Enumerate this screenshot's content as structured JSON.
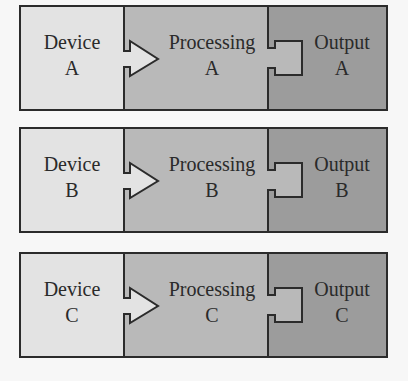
{
  "colors": {
    "device": "#e3e3e3",
    "processing": "#b9b9b9",
    "output": "#9c9c9c",
    "stroke": "#2b2b2b",
    "background": "#f7f7f7"
  },
  "rows": [
    {
      "id": "A",
      "device": {
        "title": "Device",
        "letter": "A"
      },
      "processing": {
        "title": "Processing",
        "letter": "A"
      },
      "output": {
        "title": "Output",
        "letter": "A"
      }
    },
    {
      "id": "B",
      "device": {
        "title": "Device",
        "letter": "B"
      },
      "processing": {
        "title": "Processing",
        "letter": "B"
      },
      "output": {
        "title": "Output",
        "letter": "B"
      }
    },
    {
      "id": "C",
      "device": {
        "title": "Device",
        "letter": "C"
      },
      "processing": {
        "title": "Processing",
        "letter": "C"
      },
      "output": {
        "title": "Output",
        "letter": "C"
      }
    }
  ]
}
